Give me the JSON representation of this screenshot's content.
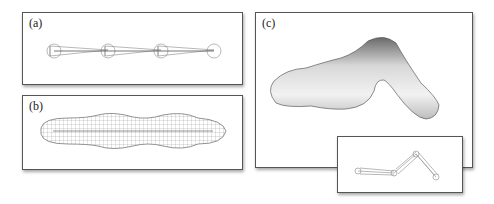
{
  "panels": {
    "a": {
      "label": "(a)",
      "description": "skeleton chain of four joints with bone cones"
    },
    "b": {
      "label": "(b)",
      "description": "wireframe mesh surface around straight skeleton"
    },
    "c": {
      "label": "(c)",
      "description": "smooth shaded bent blob surface"
    },
    "inset": {
      "description": "bent skeleton corresponding to panel c"
    }
  }
}
